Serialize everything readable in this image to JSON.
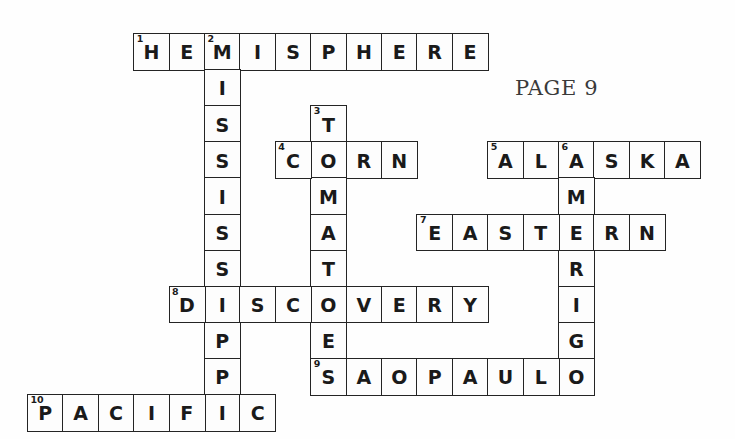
{
  "page_label": "PAGE 9",
  "grid": {
    "origin_x": 27,
    "origin_y": 33,
    "cell_w": 35.4,
    "cell_h": 36.1,
    "columns": 20,
    "rows": 11
  },
  "page_label_pos": {
    "x": 515,
    "y": 76
  },
  "colors": {
    "ink": "#242424",
    "letter": "#1a1a1a",
    "cell_fill": "#fdfdfd",
    "page_background": "#fefefe",
    "page_label": "#3a3a3a"
  },
  "entries": [
    {
      "number": "1",
      "direction": "across",
      "answer": "HEMISPHERE",
      "row": 0,
      "col": 3,
      "letters": [
        "H",
        "E",
        "M",
        "I",
        "S",
        "P",
        "H",
        "E",
        "R",
        "E"
      ]
    },
    {
      "number": "2",
      "direction": "down",
      "answer": "MISSISSIPPI",
      "row": 0,
      "col": 5,
      "letters": [
        "M",
        "I",
        "S",
        "S",
        "I",
        "S",
        "S",
        "I",
        "P",
        "P",
        "I"
      ]
    },
    {
      "number": "3",
      "direction": "down",
      "answer": "TOMATOES",
      "row": 2,
      "col": 8,
      "letters": [
        "T",
        "O",
        "M",
        "A",
        "T",
        "O",
        "E",
        "S"
      ]
    },
    {
      "number": "4",
      "direction": "across",
      "answer": "CORN",
      "row": 3,
      "col": 7,
      "letters": [
        "C",
        "O",
        "R",
        "N"
      ]
    },
    {
      "number": "5",
      "direction": "across",
      "answer": "ALASKA",
      "row": 3,
      "col": 13,
      "letters": [
        "A",
        "L",
        "A",
        "S",
        "K",
        "A"
      ]
    },
    {
      "number": "6",
      "direction": "down",
      "answer": "AMERIGO",
      "row": 3,
      "col": 15,
      "letters": [
        "A",
        "M",
        "E",
        "R",
        "I",
        "G",
        "O"
      ]
    },
    {
      "number": "7",
      "direction": "across",
      "answer": "EASTERN",
      "row": 5,
      "col": 11,
      "letters": [
        "E",
        "A",
        "S",
        "T",
        "E",
        "R",
        "N"
      ]
    },
    {
      "number": "8",
      "direction": "across",
      "answer": "DISCOVERY",
      "row": 7,
      "col": 4,
      "letters": [
        "D",
        "I",
        "S",
        "C",
        "O",
        "V",
        "E",
        "R",
        "Y"
      ]
    },
    {
      "number": "9",
      "direction": "across",
      "answer": "SAOPAULO",
      "row": 9,
      "col": 8,
      "letters": [
        "S",
        "A",
        "O",
        "P",
        "A",
        "U",
        "L",
        "O"
      ]
    },
    {
      "number": "10",
      "direction": "across",
      "answer": "PACIFIC",
      "row": 10,
      "col": 0,
      "letters": [
        "P",
        "A",
        "C",
        "I",
        "F",
        "I",
        "C"
      ]
    }
  ],
  "cell_numbers": [
    {
      "number": "1",
      "row": 0,
      "col": 3
    },
    {
      "number": "2",
      "row": 0,
      "col": 5
    },
    {
      "number": "3",
      "row": 2,
      "col": 8
    },
    {
      "number": "4",
      "row": 3,
      "col": 7
    },
    {
      "number": "5",
      "row": 3,
      "col": 13
    },
    {
      "number": "6",
      "row": 3,
      "col": 15
    },
    {
      "number": "7",
      "row": 5,
      "col": 11
    },
    {
      "number": "8",
      "row": 7,
      "col": 4
    },
    {
      "number": "9",
      "row": 9,
      "col": 8
    },
    {
      "number": "10",
      "row": 10,
      "col": 0
    }
  ]
}
